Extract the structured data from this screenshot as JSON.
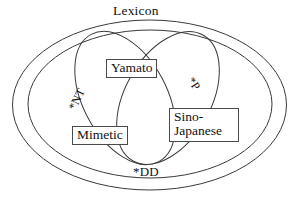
{
  "diagram": {
    "title": "Lexicon",
    "background_color": "#ffffff",
    "stroke_color": "#3a3a3a",
    "text_color": "#111111",
    "type": "venn-euler-diagram",
    "outer_set_label": "Lexicon",
    "nested_set_label": "*DD",
    "regions": [
      {
        "id": "yamato",
        "label": "Yamato",
        "boxed": true
      },
      {
        "id": "mimetic",
        "label": "Mimetic",
        "boxed": true
      },
      {
        "id": "sino-japanese",
        "label_line1": "Sino-",
        "label_line2": "Japanese",
        "boxed": true
      }
    ],
    "constraint_labels": [
      {
        "id": "nt",
        "label": "*NT",
        "rotation_deg": -64
      },
      {
        "id": "p",
        "label": "*P",
        "rotation_deg": 56
      },
      {
        "id": "dd",
        "label": "*DD",
        "rotation_deg": 0
      }
    ]
  }
}
